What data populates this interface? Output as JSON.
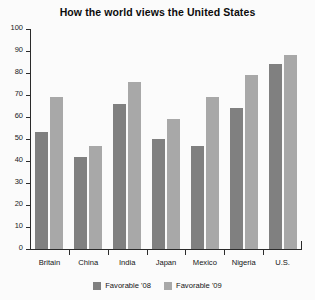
{
  "chart_data": {
    "type": "bar",
    "title": "How the world views the United States",
    "xlabel": "",
    "ylabel": "",
    "categories": [
      "Britain",
      "China",
      "India",
      "Japan",
      "Mexico",
      "Nigeria",
      "U.S."
    ],
    "series": [
      {
        "name": "Favorable '08",
        "color": "#808080",
        "values": [
          53,
          42,
          66,
          50,
          47,
          64,
          84
        ]
      },
      {
        "name": "Favorable '09",
        "color": "#a8a8a8",
        "values": [
          69,
          47,
          76,
          59,
          69,
          79,
          88
        ]
      }
    ],
    "ylim": [
      0,
      100
    ],
    "yticks": [
      0,
      10,
      20,
      30,
      40,
      50,
      60,
      70,
      80,
      90,
      100
    ],
    "ytick_labels": [
      "0",
      "10",
      "20",
      "30",
      "40",
      "50",
      "60",
      "70",
      "80",
      "90",
      "100"
    ],
    "grid": false,
    "legend_position": "bottom"
  }
}
